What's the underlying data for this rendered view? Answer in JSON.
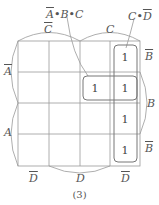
{
  "diagram": {
    "caption": "(3)",
    "annotations": {
      "term1": "A̅•B•C",
      "term2": "C•D̅"
    },
    "top_labels": [
      {
        "text": "C",
        "overline": true
      },
      {
        "text": "C",
        "overline": false
      }
    ],
    "left_labels": [
      {
        "text": "A",
        "overline": true
      },
      {
        "text": "A",
        "overline": false
      }
    ],
    "right_labels": [
      {
        "text": "B",
        "overline": true
      },
      {
        "text": "B",
        "overline": false
      },
      {
        "text": "B",
        "overline": true
      }
    ],
    "bottom_labels": [
      {
        "text": "D",
        "overline": true
      },
      {
        "text": "D",
        "overline": false
      },
      {
        "text": "D",
        "overline": true
      }
    ],
    "cells": [
      [
        "",
        "",
        "",
        "1"
      ],
      [
        "",
        "",
        "1",
        "1"
      ],
      [
        "",
        "",
        "",
        "1"
      ],
      [
        "",
        "",
        "",
        "1"
      ]
    ],
    "groups": [
      {
        "name": "A̅•B•C",
        "cells": [
          [
            1,
            2
          ],
          [
            1,
            3
          ]
        ]
      },
      {
        "name": "C•D̅",
        "cells": [
          [
            0,
            3
          ],
          [
            1,
            3
          ],
          [
            2,
            3
          ],
          [
            3,
            3
          ]
        ]
      }
    ]
  }
}
